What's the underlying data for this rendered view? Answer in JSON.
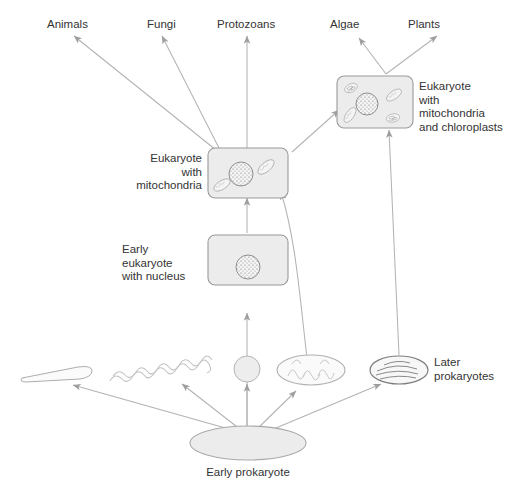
{
  "diagram": {
    "type": "flow-diagram",
    "colors": {
      "text": "#333333",
      "box_fill": "#ececec",
      "box_stroke": "#9a9a9a",
      "arrow": "#b0b0b0",
      "organelle_stroke": "#9a9a9a",
      "organelle_fill": "#f2f2f2",
      "background": "#ffffff"
    }
  },
  "outcomes": {
    "animals": "Animals",
    "fungi": "Fungi",
    "protozoans": "Protozoans",
    "algae": "Algae",
    "plants": "Plants"
  },
  "cells": {
    "eukaryote_mito": {
      "label": "Eukaryote\nwith\nmitochondria",
      "contents": [
        "nucleus",
        "mitochondrion",
        "mitochondrion"
      ]
    },
    "eukaryote_mito_chloro": {
      "label": "Eukaryote\nwith\nmitochondria\nand chloroplasts",
      "contents": [
        "nucleus",
        "mitochondrion",
        "mitochondrion",
        "chloroplast",
        "chloroplast"
      ]
    },
    "early_eukaryote": {
      "label": "Early\neukaryote\nwith nucleus",
      "contents": [
        "nucleus"
      ]
    }
  },
  "prokaryotes": {
    "later_label": "Later\nprokaryotes",
    "early_label": "Early prokaryote",
    "forms": [
      {
        "name": "rod-bacterium",
        "shape": "rod"
      },
      {
        "name": "spiral-bacterium",
        "shape": "spirochete"
      },
      {
        "name": "coccus-bacterium",
        "shape": "sphere"
      },
      {
        "name": "proto-mitochondrion",
        "shape": "ellipse-cristae"
      },
      {
        "name": "cyanobacterium",
        "shape": "ellipse-thylakoids"
      }
    ]
  }
}
